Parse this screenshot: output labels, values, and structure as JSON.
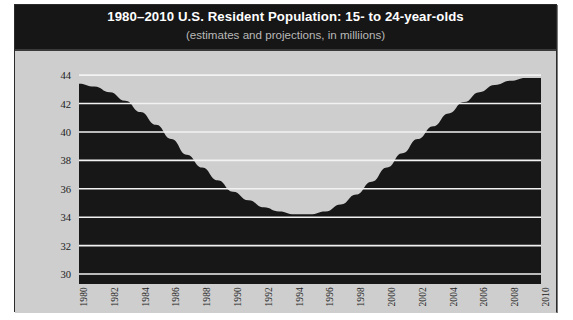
{
  "figure": {
    "title": "1980–2010 U.S. Resident Population: 15- to 24-year-olds",
    "subtitle": "(estimates and projections, in milliions)",
    "header_background": "#161616",
    "body_background": "#cecece",
    "plot_fill": "#171717",
    "gridline_color": "#f2f2f2",
    "title_color": "#ffffff",
    "subtitle_color": "#b9b9b9"
  },
  "chart_data": {
    "type": "area",
    "title": "1980–2010 U.S. Resident Population: 15- to 24-year-olds",
    "subtitle": "(estimates and projections, in milliions)",
    "xlabel": "",
    "ylabel": "",
    "units": "millions",
    "grid": true,
    "legend": "none",
    "xlim": [
      1980,
      2010
    ],
    "ylim": [
      29.3,
      44.5
    ],
    "yticks": [
      30,
      32,
      34,
      36,
      38,
      40,
      42,
      44
    ],
    "ytick_labels": [
      "30",
      "32",
      "34",
      "36",
      "38",
      "40",
      "42",
      "44"
    ],
    "xticks": [
      1980,
      1982,
      1984,
      1986,
      1988,
      1990,
      1992,
      1994,
      1996,
      1998,
      2000,
      2002,
      2004,
      2006,
      2008,
      2010
    ],
    "xtick_labels": [
      "1980",
      "1982",
      "1984",
      "1986",
      "1988",
      "1990",
      "1992",
      "1994",
      "1996",
      "1998",
      "2000",
      "2002",
      "2004",
      "2006",
      "2008",
      "2010"
    ],
    "x": [
      1980,
      1981,
      1982,
      1983,
      1984,
      1985,
      1986,
      1987,
      1988,
      1989,
      1990,
      1991,
      1992,
      1993,
      1994,
      1995,
      1996,
      1997,
      1998,
      1999,
      2000,
      2001,
      2002,
      2003,
      2004,
      2005,
      2006,
      2007,
      2008,
      2009,
      2010
    ],
    "values": [
      43.4,
      43.2,
      42.8,
      42.2,
      41.4,
      40.5,
      39.5,
      38.4,
      37.5,
      36.6,
      35.8,
      35.2,
      34.7,
      34.4,
      34.2,
      34.2,
      34.4,
      34.9,
      35.6,
      36.5,
      37.5,
      38.5,
      39.5,
      40.4,
      41.3,
      42.1,
      42.8,
      43.3,
      43.6,
      43.8,
      43.8
    ],
    "series": [
      {
        "name": "U.S. resident population, ages 15–24",
        "values": [
          43.4,
          43.2,
          42.8,
          42.2,
          41.4,
          40.5,
          39.5,
          38.4,
          37.5,
          36.6,
          35.8,
          35.2,
          34.7,
          34.4,
          34.2,
          34.2,
          34.4,
          34.9,
          35.6,
          36.5,
          37.5,
          38.5,
          39.5,
          40.4,
          41.3,
          42.1,
          42.8,
          43.3,
          43.6,
          43.8,
          43.8
        ]
      }
    ],
    "annotations": {
      "peak_start": 43.4,
      "minimum": 34.2,
      "minimum_years": [
        1994,
        1995
      ],
      "peak_end": 43.8
    }
  }
}
